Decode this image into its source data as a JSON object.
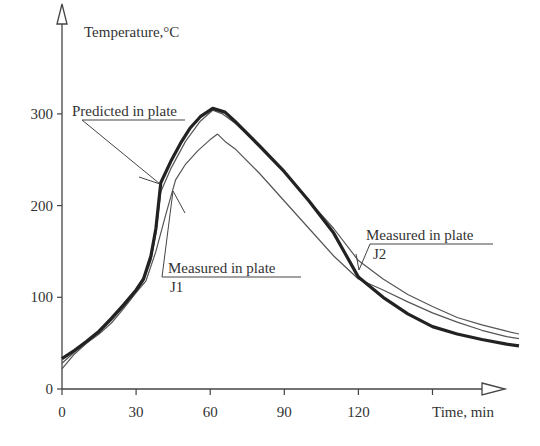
{
  "chart_data": {
    "type": "line",
    "title": "",
    "xlabel": "Time, min",
    "ylabel": "Temperature,°C",
    "xlim": [
      0,
      185
    ],
    "ylim": [
      0,
      340
    ],
    "x_ticks": [
      0,
      30,
      60,
      90,
      120,
      150
    ],
    "x_tick_labels": [
      "0",
      "30",
      "60",
      "90",
      "120",
      ""
    ],
    "y_ticks": [
      0,
      100,
      200,
      300
    ],
    "y_tick_labels": [
      "0",
      "100",
      "200",
      "300"
    ],
    "grid": false,
    "legend": "none (callout annotations)",
    "series": [
      {
        "name": "Predicted in plate",
        "style": "thick",
        "x": [
          0,
          5,
          10,
          15,
          20,
          25,
          30,
          33,
          36,
          38,
          40,
          44,
          48,
          52,
          56,
          61,
          66,
          70,
          80,
          90,
          100,
          110,
          120,
          130,
          140,
          150,
          160,
          170,
          180,
          185
        ],
        "y": [
          33,
          42,
          52,
          63,
          77,
          92,
          108,
          120,
          145,
          175,
          225,
          248,
          268,
          285,
          297,
          306,
          302,
          292,
          265,
          237,
          205,
          170,
          122,
          100,
          82,
          68,
          60,
          54,
          49,
          47
        ]
      },
      {
        "name": "Measured in plate J2",
        "style": "thin",
        "x": [
          0,
          5,
          10,
          15,
          20,
          25,
          30,
          33,
          36,
          38,
          40,
          44,
          50,
          56,
          61,
          65,
          70,
          80,
          90,
          100,
          110,
          120,
          130,
          140,
          150,
          160,
          170,
          180,
          185
        ],
        "y": [
          28,
          40,
          50,
          62,
          75,
          90,
          106,
          118,
          140,
          170,
          215,
          240,
          270,
          292,
          304,
          300,
          290,
          265,
          238,
          205,
          175,
          140,
          120,
          103,
          90,
          78,
          70,
          63,
          60
        ]
      },
      {
        "name": "Measured in plate J1",
        "style": "thin",
        "x": [
          0,
          5,
          10,
          15,
          20,
          25,
          30,
          34,
          38,
          42,
          46,
          50,
          55,
          60,
          63,
          66,
          70,
          80,
          90,
          100,
          110,
          120,
          130,
          140,
          150,
          160,
          170,
          180,
          185
        ],
        "y": [
          22,
          38,
          50,
          60,
          72,
          88,
          105,
          118,
          150,
          190,
          228,
          245,
          260,
          272,
          278,
          270,
          262,
          235,
          205,
          175,
          145,
          120,
          108,
          95,
          83,
          73,
          64,
          57,
          55
        ]
      }
    ],
    "annotations": [
      {
        "text": "Predicted in plate",
        "points_to": [
          40,
          225
        ]
      },
      {
        "text": "Measured in plate",
        "sub": "J1",
        "points_to": [
          45,
          215
        ]
      },
      {
        "text": "Measured in plate",
        "sub": "J2",
        "points_to": [
          118,
          135
        ]
      }
    ]
  },
  "labels": {
    "ylabel": "Temperature,°C",
    "xlabel": "Time, min",
    "ann_pred": "Predicted in plate",
    "ann_j1": "Measured in plate",
    "ann_j1_sub": "J1",
    "ann_j2": "Measured in plate",
    "ann_j2_sub": "J2"
  }
}
